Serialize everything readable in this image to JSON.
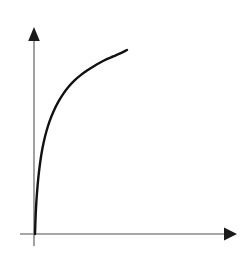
{
  "figure": {
    "title": "",
    "background_color": "#ffffff",
    "width": 248,
    "height": 254
  },
  "axes": {
    "origin": {
      "x": 34,
      "y": 234
    },
    "x_axis": {
      "label": "",
      "color": "#8a8a8a",
      "start_x": 20,
      "end_x": 228,
      "y": 234,
      "arrow": "right-arrow",
      "arrow_tip_x": 237,
      "ticks": [],
      "tick_labels": []
    },
    "y_axis": {
      "label": "",
      "color": "#8a8a8a",
      "x": 34,
      "start_y": 246,
      "end_y": 38,
      "arrow": "up-arrow",
      "arrow_tip_y": 27,
      "ticks": [],
      "tick_labels": []
    }
  },
  "chart_data": {
    "type": "line",
    "title": "",
    "subtitle": "",
    "xlabel": "",
    "ylabel": "",
    "grid": false,
    "legend": null,
    "legend_position": "none",
    "xlim": [
      0,
      1
    ],
    "ylim": [
      0,
      1
    ],
    "axis_ticks_shown": false,
    "series": [
      {
        "name": "saturating-growth",
        "color": "#111111",
        "line_width": 2.4,
        "x": [
          0.0,
          0.005,
          0.012,
          0.022,
          0.035,
          0.05,
          0.07,
          0.095,
          0.125,
          0.16,
          0.2,
          0.25,
          0.305,
          0.365,
          0.43,
          0.5,
          0.57,
          0.64,
          0.71,
          0.78,
          0.85,
          0.92,
          1.0
        ],
        "y": [
          0.0,
          0.075,
          0.15,
          0.225,
          0.3,
          0.365,
          0.435,
          0.5,
          0.56,
          0.615,
          0.665,
          0.715,
          0.76,
          0.8,
          0.835,
          0.865,
          0.89,
          0.912,
          0.932,
          0.95,
          0.965,
          0.98,
          1.0
        ]
      }
    ],
    "pixel_path": {
      "start": {
        "x": 35,
        "y": 234
      },
      "end": {
        "x": 127,
        "y": 50
      },
      "control_points": [
        {
          "x": 36,
          "y": 180
        },
        {
          "x": 38,
          "y": 150
        },
        {
          "x": 41,
          "y": 120
        },
        {
          "x": 48,
          "y": 100
        },
        {
          "x": 55,
          "y": 90
        },
        {
          "x": 78,
          "y": 65
        },
        {
          "x": 100,
          "y": 54
        }
      ]
    }
  }
}
